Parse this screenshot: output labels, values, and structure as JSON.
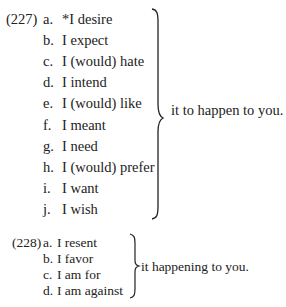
{
  "examples": [
    {
      "number": "(227)",
      "items": [
        {
          "letter": "a.",
          "text": "*I desire"
        },
        {
          "letter": "b.",
          "text": "I expect"
        },
        {
          "letter": "c.",
          "text": "I (would) hate"
        },
        {
          "letter": "d.",
          "text": "I intend"
        },
        {
          "letter": "e.",
          "text": "I (would) like"
        },
        {
          "letter": "f.",
          "text": "I meant"
        },
        {
          "letter": "g.",
          "text": "I need"
        },
        {
          "letter": "h.",
          "text": "I (would) prefer"
        },
        {
          "letter": "i.",
          "text": "I want"
        },
        {
          "letter": "j.",
          "text": "I wish"
        }
      ],
      "complement": "it to happen to you."
    },
    {
      "number": "(228)",
      "items": [
        {
          "letter": "a.",
          "text": "I resent"
        },
        {
          "letter": "b.",
          "text": "I favor"
        },
        {
          "letter": "c.",
          "text": "I am for"
        },
        {
          "letter": "d.",
          "text": "I am against"
        }
      ],
      "complement": "it happening to you."
    }
  ]
}
